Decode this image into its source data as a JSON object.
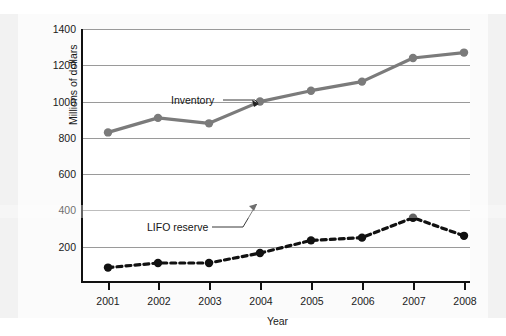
{
  "chart_data": {
    "type": "line",
    "title": "",
    "xlabel": "Year",
    "ylabel": "Millions of dollars",
    "categories": [
      "2001",
      "2002",
      "2003",
      "2004",
      "2005",
      "2006",
      "2007",
      "2008"
    ],
    "x": [
      2001,
      2002,
      2003,
      2004,
      2005,
      2006,
      2007,
      2008
    ],
    "ylim": [
      0,
      1400
    ],
    "yticks": [
      200,
      400,
      600,
      800,
      1000,
      1200,
      1400
    ],
    "ytick_labels": [
      "200",
      "400",
      "600",
      "800",
      "1000",
      "1200",
      "1400"
    ],
    "grid": "horizontal",
    "legend": "inline-annotations",
    "series": [
      {
        "name": "Inventory",
        "style": "solid",
        "color": "#7b7b7b",
        "marker": "circle",
        "values": [
          830,
          910,
          880,
          1000,
          1060,
          1110,
          1240,
          1270
        ]
      },
      {
        "name": "LIFO reserve",
        "style": "dashed",
        "color": "#111111",
        "marker": "circle",
        "values": [
          85,
          110,
          110,
          165,
          235,
          250,
          360,
          260
        ]
      }
    ],
    "annotations": [
      {
        "text": "Inventory",
        "points_to_year": 2004,
        "points_to_value": 1000
      },
      {
        "text": "LIFO reserve",
        "points_to_year": 2004,
        "points_to_value": 165
      }
    ]
  }
}
